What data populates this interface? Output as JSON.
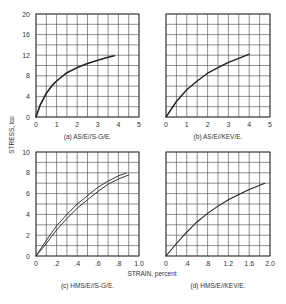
{
  "figure": {
    "ylabel": "STRESS, ksi",
    "xlabel": "STRAIN, percent"
  },
  "chart_data": [
    {
      "type": "line",
      "title": "(a) AS/E//S-G/E.",
      "xlabel": "STRAIN, percent",
      "ylabel": "STRESS, ksi",
      "xlim": [
        0,
        5
      ],
      "ylim": [
        0,
        20
      ],
      "xticks": [
        "0",
        "1",
        "2",
        "3",
        "4",
        "5"
      ],
      "yticks": [
        "0",
        "4",
        "8",
        "12",
        "16",
        "20"
      ],
      "grid": true,
      "series": [
        {
          "name": "curve",
          "x": [
            0,
            0.2,
            0.5,
            0.8,
            1.0,
            1.5,
            2.0,
            2.5,
            3.0,
            3.5,
            3.8
          ],
          "y": [
            0,
            2.3,
            4.6,
            6.2,
            7.0,
            8.6,
            9.6,
            10.4,
            11.0,
            11.6,
            11.9
          ]
        }
      ]
    },
    {
      "type": "line",
      "title": "(b) AS/E//KEV/E.",
      "xlabel": "STRAIN, percent",
      "ylabel": "STRESS, ksi",
      "xlim": [
        0,
        5
      ],
      "ylim": [
        0,
        20
      ],
      "xticks": [
        "0",
        "1",
        "2",
        "3",
        "4",
        "5"
      ],
      "yticks": [],
      "grid": true,
      "series": [
        {
          "name": "curve",
          "x": [
            0,
            0.5,
            1.0,
            1.5,
            2.0,
            2.5,
            3.0,
            3.5,
            4.0
          ],
          "y": [
            0,
            3.0,
            5.3,
            7.0,
            8.5,
            9.6,
            10.6,
            11.4,
            12.2
          ]
        }
      ]
    },
    {
      "type": "line",
      "title": "(c) HMS/E//S-G/E.",
      "xlabel": "STRAIN, percent",
      "ylabel": "STRESS, ksi",
      "xlim": [
        0,
        1.0
      ],
      "ylim": [
        0,
        10
      ],
      "xticks": [
        "0",
        ".2",
        ".4",
        ".6",
        ".8",
        "1.0"
      ],
      "yticks": [
        "0",
        "2",
        "4",
        "6",
        "8",
        "10"
      ],
      "grid": true,
      "series": [
        {
          "name": "upper",
          "x": [
            0,
            0.1,
            0.2,
            0.3,
            0.4,
            0.5,
            0.6,
            0.7,
            0.8,
            0.88
          ],
          "y": [
            0,
            1.5,
            2.9,
            4.0,
            5.0,
            5.8,
            6.6,
            7.2,
            7.7,
            8.0
          ]
        },
        {
          "name": "lower",
          "x": [
            0,
            0.1,
            0.2,
            0.3,
            0.4,
            0.5,
            0.6,
            0.7,
            0.8,
            0.9
          ],
          "y": [
            0,
            1.2,
            2.5,
            3.6,
            4.6,
            5.4,
            6.2,
            6.9,
            7.4,
            7.8
          ]
        }
      ]
    },
    {
      "type": "line",
      "title": "(d) HMS/E//KEV/E.",
      "xlabel": "STRAIN, percent",
      "ylabel": "STRESS, ksi",
      "xlim": [
        0,
        2.0
      ],
      "ylim": [
        0,
        10
      ],
      "xticks": [
        "0",
        ".4",
        ".8",
        "1.2",
        "1.6",
        "2.0"
      ],
      "yticks": [],
      "grid": true,
      "series": [
        {
          "name": "curve",
          "x": [
            0,
            0.2,
            0.4,
            0.6,
            0.8,
            1.0,
            1.2,
            1.4,
            1.6,
            1.9
          ],
          "y": [
            0,
            1.2,
            2.3,
            3.3,
            4.1,
            4.8,
            5.4,
            5.9,
            6.4,
            7.0
          ]
        }
      ]
    }
  ]
}
